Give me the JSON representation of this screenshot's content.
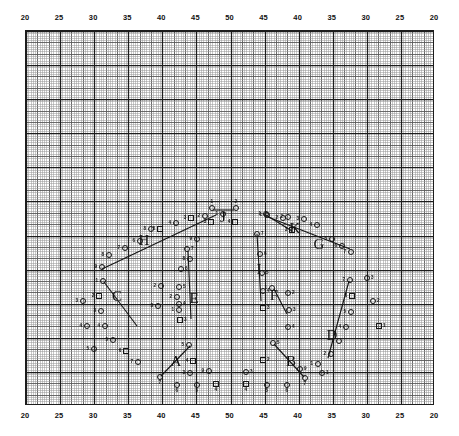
{
  "figure": {
    "background": "#ffffff",
    "ink": "#151515",
    "width": 459,
    "height": 436
  },
  "axes": {
    "top_ticks": [
      "20",
      "25",
      "30",
      "35",
      "40",
      "45",
      "50",
      "45",
      "40",
      "35",
      "30",
      "25",
      "20"
    ],
    "bottom_ticks": [
      "20",
      "25",
      "30",
      "35",
      "40",
      "45",
      "50",
      "45",
      "40",
      "35",
      "30",
      "25",
      "20"
    ],
    "tick_count": 13
  },
  "grid": {
    "minor_color": "#9a9a9a",
    "medium_color": "#5a5a5a",
    "major_color": "#1d1d1d",
    "minor_step_px": 2.28,
    "medium_every": 5,
    "major_every": 15,
    "frame_color": "#1d1d1d"
  },
  "chart_data": {
    "type": "scatter",
    "title": "",
    "xlabel": "",
    "ylabel": "",
    "xlim": [
      20,
      50,
      20
    ],
    "grid": true,
    "legend": false,
    "group_labels": [
      "A",
      "B",
      "C",
      "D",
      "E",
      "F",
      "G",
      "H",
      "I",
      "J",
      "K"
    ],
    "groups": [
      {
        "name": "H",
        "label_x": 143,
        "label_y": 239,
        "leader": [
          [
            101,
            268
          ],
          [
            215,
            214
          ]
        ],
        "points": [
          {
            "n": "1",
            "x": 222,
            "y": 213,
            "shape": "circle",
            "num_side": "left"
          },
          {
            "n": "2",
            "x": 204,
            "y": 215,
            "shape": "circle",
            "num_side": "left"
          },
          {
            "n": "3",
            "x": 190,
            "y": 217,
            "shape": "square",
            "num_side": "left"
          },
          {
            "n": "4",
            "x": 175,
            "y": 222,
            "shape": "circle",
            "num_side": "left"
          },
          {
            "n": "5",
            "x": 159,
            "y": 228,
            "shape": "square",
            "num_side": "left"
          },
          {
            "n": "6",
            "x": 139,
            "y": 240,
            "shape": "circle",
            "num_side": "left"
          },
          {
            "n": "7",
            "x": 124,
            "y": 247,
            "shape": "circle",
            "num_side": "left"
          },
          {
            "n": "8",
            "x": 108,
            "y": 254,
            "shape": "circle",
            "num_side": "left"
          },
          {
            "n": "9",
            "x": 101,
            "y": 266,
            "shape": "circle",
            "num_side": "left"
          }
        ]
      },
      {
        "name": "G",
        "label_x": 318,
        "label_y": 243,
        "leader": [
          [
            267,
            216
          ],
          [
            349,
            248
          ]
        ],
        "points": [
          {
            "n": "1",
            "x": 266,
            "y": 214,
            "shape": "circle",
            "num_side": "left"
          },
          {
            "n": "2",
            "x": 287,
            "y": 216,
            "shape": "circle",
            "num_side": "left"
          },
          {
            "n": "3",
            "x": 303,
            "y": 218,
            "shape": "circle",
            "num_side": "left"
          },
          {
            "n": "4",
            "x": 316,
            "y": 224,
            "shape": "circle",
            "num_side": "left"
          },
          {
            "n": "5",
            "x": 331,
            "y": 238,
            "shape": "circle",
            "num_side": "left"
          },
          {
            "n": "6",
            "x": 341,
            "y": 245,
            "shape": "circle",
            "num_side": "left"
          },
          {
            "n": "7",
            "x": 350,
            "y": 251,
            "shape": "circle",
            "num_side": "left"
          }
        ]
      },
      {
        "name": "J",
        "label_x": 222,
        "label_y": 216,
        "leader": [
          [
            212,
            209
          ],
          [
            233,
            209
          ]
        ],
        "points": [
          {
            "n": "1",
            "x": 211,
            "y": 207,
            "shape": "circle",
            "num_side": "top"
          },
          {
            "n": "2",
            "x": 235,
            "y": 207,
            "shape": "circle",
            "num_side": "top"
          },
          {
            "n": "3",
            "x": 210,
            "y": 221,
            "shape": "square",
            "num_side": "left"
          },
          {
            "n": "4",
            "x": 234,
            "y": 221,
            "shape": "square",
            "num_side": "left"
          }
        ]
      },
      {
        "name": "K",
        "label_x": 294,
        "label_y": 227,
        "leader": [
          [
            265,
            214
          ],
          [
            291,
            230
          ]
        ],
        "points": [
          {
            "n": "1",
            "x": 265,
            "y": 213,
            "shape": "circle",
            "num_side": "left"
          },
          {
            "n": "2",
            "x": 282,
            "y": 217,
            "shape": "circle",
            "num_side": "left"
          },
          {
            "n": "3",
            "x": 291,
            "y": 229,
            "shape": "square",
            "num_side": "left"
          }
        ]
      },
      {
        "name": "I",
        "label_x": 258,
        "label_y": 268,
        "leader": [
          [
            256,
            233
          ],
          [
            260,
            300
          ]
        ],
        "points": [
          {
            "n": "7",
            "x": 256,
            "y": 233,
            "shape": "circle",
            "num_side": "right"
          },
          {
            "n": "6",
            "x": 259,
            "y": 253,
            "shape": "circle",
            "num_side": "right"
          },
          {
            "n": "5",
            "x": 261,
            "y": 272,
            "shape": "circle",
            "num_side": "right"
          },
          {
            "n": "4",
            "x": 262,
            "y": 290,
            "shape": "circle",
            "num_side": "right"
          },
          {
            "n": "3",
            "x": 262,
            "y": 307,
            "shape": "square",
            "num_side": "right"
          }
        ]
      },
      {
        "name": "E",
        "label_x": 193,
        "label_y": 297,
        "leader": [
          [
            187,
            250
          ],
          [
            190,
            318
          ]
        ],
        "points": [
          {
            "n": "7",
            "x": 186,
            "y": 248,
            "shape": "circle",
            "num_side": "right"
          },
          {
            "n": "6",
            "x": 180,
            "y": 268,
            "shape": "circle",
            "num_side": "right"
          },
          {
            "n": "5",
            "x": 178,
            "y": 286,
            "shape": "circle",
            "num_side": "right"
          },
          {
            "n": "4",
            "x": 178,
            "y": 303,
            "shape": "circle",
            "num_side": "right"
          },
          {
            "n": "3",
            "x": 179,
            "y": 319,
            "shape": "square",
            "num_side": "right"
          },
          {
            "n": "2",
            "x": 176,
            "y": 296,
            "shape": "circle",
            "num_side": "left"
          },
          {
            "n": "1",
            "x": 178,
            "y": 309,
            "shape": "circle",
            "num_side": "left"
          }
        ]
      },
      {
        "name": "F",
        "label_x": 273,
        "label_y": 294,
        "leader": [
          [
            273,
            288
          ],
          [
            286,
            313
          ]
        ],
        "points": [
          {
            "n": "1",
            "x": 271,
            "y": 287,
            "shape": "circle",
            "num_side": "left"
          },
          {
            "n": "2",
            "x": 287,
            "y": 292,
            "shape": "circle",
            "num_side": "right"
          },
          {
            "n": "3",
            "x": 288,
            "y": 309,
            "shape": "circle",
            "num_side": "right"
          },
          {
            "n": "4",
            "x": 287,
            "y": 326,
            "shape": "circle",
            "num_side": "right"
          }
        ]
      },
      {
        "name": "C",
        "label_x": 116,
        "label_y": 295,
        "leader": [
          [
            103,
            281
          ],
          [
            136,
            325
          ]
        ],
        "points": [
          {
            "n": "1",
            "x": 102,
            "y": 280,
            "shape": "circle",
            "num_side": "left"
          },
          {
            "n": "2",
            "x": 98,
            "y": 295,
            "shape": "square",
            "num_side": "left"
          },
          {
            "n": "3",
            "x": 100,
            "y": 310,
            "shape": "circle",
            "num_side": "left"
          },
          {
            "n": "4",
            "x": 104,
            "y": 325,
            "shape": "circle",
            "num_side": "left"
          },
          {
            "n": "5",
            "x": 112,
            "y": 339,
            "shape": "circle",
            "num_side": "left"
          },
          {
            "n": "6",
            "x": 125,
            "y": 350,
            "shape": "square",
            "num_side": "left"
          },
          {
            "n": "7",
            "x": 137,
            "y": 361,
            "shape": "circle",
            "num_side": "left"
          }
        ]
      },
      {
        "name": "D",
        "label_x": 331,
        "label_y": 334,
        "leader": [
          [
            348,
            280
          ],
          [
            327,
            357
          ]
        ],
        "points": [
          {
            "n": "7",
            "x": 349,
            "y": 279,
            "shape": "circle",
            "num_side": "left"
          },
          {
            "n": "6",
            "x": 351,
            "y": 295,
            "shape": "square",
            "num_side": "left"
          },
          {
            "n": "5",
            "x": 350,
            "y": 311,
            "shape": "circle",
            "num_side": "left"
          },
          {
            "n": "4",
            "x": 345,
            "y": 326,
            "shape": "circle",
            "num_side": "left"
          },
          {
            "n": "3",
            "x": 338,
            "y": 340,
            "shape": "circle",
            "num_side": "left"
          },
          {
            "n": "2",
            "x": 330,
            "y": 353,
            "shape": "circle",
            "num_side": "left"
          },
          {
            "n": "1",
            "x": 317,
            "y": 363,
            "shape": "circle",
            "num_side": "left"
          }
        ]
      },
      {
        "name": "A",
        "label_x": 175,
        "label_y": 360,
        "leader": [
          [
            189,
            345
          ],
          [
            160,
            375
          ]
        ],
        "points": [
          {
            "n": "5",
            "x": 188,
            "y": 344,
            "shape": "circle",
            "num_side": "left"
          },
          {
            "n": "4",
            "x": 192,
            "y": 360,
            "shape": "square",
            "num_side": "left"
          },
          {
            "n": "3",
            "x": 189,
            "y": 372,
            "shape": "circle",
            "num_side": "left"
          },
          {
            "n": "7",
            "x": 159,
            "y": 376,
            "shape": "circle",
            "num_side": "bottom"
          },
          {
            "n": "6",
            "x": 176,
            "y": 384,
            "shape": "circle",
            "num_side": "bottom"
          },
          {
            "n": "5b",
            "x": 196,
            "y": 384,
            "shape": "circle",
            "num_side": "bottom"
          },
          {
            "n": "4b",
            "x": 215,
            "y": 383,
            "shape": "square",
            "num_side": "bottom"
          }
        ]
      },
      {
        "name": "B",
        "label_x": 290,
        "label_y": 360,
        "leader": [
          [
            273,
            343
          ],
          [
            303,
            376
          ]
        ],
        "points": [
          {
            "n": "5",
            "x": 272,
            "y": 342,
            "shape": "circle",
            "num_side": "right"
          },
          {
            "n": "2",
            "x": 262,
            "y": 359,
            "shape": "square",
            "num_side": "right"
          },
          {
            "n": "3",
            "x": 245,
            "y": 371,
            "shape": "circle",
            "num_side": "right"
          },
          {
            "n": "4",
            "x": 245,
            "y": 383,
            "shape": "square",
            "num_side": "bottom"
          },
          {
            "n": "5c",
            "x": 266,
            "y": 384,
            "shape": "circle",
            "num_side": "bottom"
          },
          {
            "n": "6",
            "x": 286,
            "y": 384,
            "shape": "circle",
            "num_side": "bottom"
          },
          {
            "n": "7",
            "x": 304,
            "y": 377,
            "shape": "circle",
            "num_side": "bottom"
          },
          {
            "n": "1",
            "x": 321,
            "y": 372,
            "shape": "circle",
            "num_side": "right"
          }
        ]
      },
      {
        "name": "loose",
        "label_x": null,
        "label_y": null,
        "leader": null,
        "points": [
          {
            "n": "8",
            "x": 150,
            "y": 228,
            "shape": "circle",
            "num_side": "left"
          },
          {
            "n": "9",
            "x": 196,
            "y": 238,
            "shape": "circle",
            "num_side": "left"
          },
          {
            "n": "8b",
            "x": 189,
            "y": 258,
            "shape": "circle",
            "num_side": "left"
          },
          {
            "n": "2",
            "x": 160,
            "y": 285,
            "shape": "circle",
            "num_side": "left"
          },
          {
            "n": "3",
            "x": 157,
            "y": 305,
            "shape": "circle",
            "num_side": "left"
          },
          {
            "n": "9b",
            "x": 208,
            "y": 370,
            "shape": "circle",
            "num_side": "left"
          },
          {
            "n": "9c",
            "x": 299,
            "y": 368,
            "shape": "circle",
            "num_side": "right"
          },
          {
            "n": "1",
            "x": 378,
            "y": 325,
            "shape": "square",
            "num_side": "right"
          },
          {
            "n": "2c",
            "x": 372,
            "y": 300,
            "shape": "circle",
            "num_side": "right"
          },
          {
            "n": "3c",
            "x": 366,
            "y": 277,
            "shape": "circle",
            "num_side": "right"
          },
          {
            "n": "3d",
            "x": 82,
            "y": 300,
            "shape": "circle",
            "num_side": "left"
          },
          {
            "n": "4d",
            "x": 86,
            "y": 325,
            "shape": "circle",
            "num_side": "left"
          },
          {
            "n": "5d",
            "x": 93,
            "y": 348,
            "shape": "circle",
            "num_side": "left"
          }
        ]
      }
    ]
  }
}
